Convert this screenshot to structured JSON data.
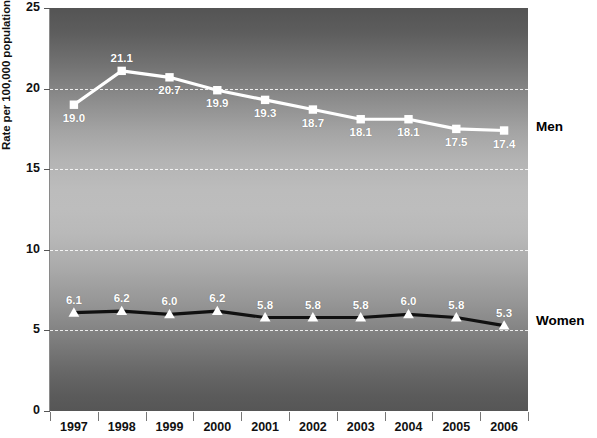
{
  "chart_data": {
    "type": "line",
    "title": "",
    "xlabel": "",
    "ylabel": "Rate per 100,000 population",
    "categories": [
      "1997",
      "1998",
      "1999",
      "2000",
      "2001",
      "2002",
      "2003",
      "2004",
      "2005",
      "2006"
    ],
    "ylim": [
      0,
      25
    ],
    "yticks": [
      0,
      5,
      10,
      15,
      20,
      25
    ],
    "ytick_labels": [
      "0",
      "5",
      "10",
      "15",
      "20",
      "25"
    ],
    "grid": true,
    "legend_position": "right-of-series-end",
    "series": [
      {
        "name": "Men",
        "marker": "square",
        "line_color": "#ffffff",
        "marker_color": "#ffffff",
        "values": [
          19.0,
          21.1,
          20.7,
          19.9,
          19.3,
          18.7,
          18.1,
          18.1,
          17.5,
          17.4
        ],
        "value_labels": [
          "19.0",
          "21.1",
          "20.7",
          "19.9",
          "19.3",
          "18.7",
          "18.1",
          "18.1",
          "17.5",
          "17.4"
        ]
      },
      {
        "name": "Women",
        "marker": "triangle",
        "line_color": "#111111",
        "marker_color": "#ffffff",
        "values": [
          6.1,
          6.2,
          6.0,
          6.2,
          5.8,
          5.8,
          5.8,
          6.0,
          5.8,
          5.3
        ],
        "value_labels": [
          "6.1",
          "6.2",
          "6.0",
          "6.2",
          "5.8",
          "5.8",
          "5.8",
          "6.0",
          "5.8",
          "5.3"
        ]
      }
    ]
  },
  "axes": {
    "y_title": "Rate per 100,000 population",
    "y_labels": [
      "25",
      "20",
      "15",
      "10",
      "5",
      "0"
    ],
    "x_labels": [
      "1997",
      "1998",
      "1999",
      "2000",
      "2001",
      "2002",
      "2003",
      "2004",
      "2005",
      "2006"
    ]
  },
  "series_labels": {
    "men": "Men",
    "women": "Women"
  }
}
